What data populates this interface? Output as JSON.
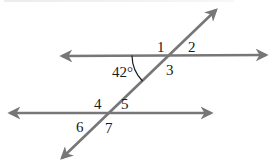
{
  "diagram": {
    "type": "parallel-lines-transversal",
    "colors": {
      "line": "#777777",
      "text": "#1a1a1a",
      "background": "#ffffff"
    },
    "lines": {
      "upper_parallel": {
        "x1": 62,
        "y1": 56,
        "x2": 266,
        "y2": 55
      },
      "lower_parallel": {
        "x1": 10,
        "y1": 113,
        "x2": 211,
        "y2": 113
      },
      "transversal": {
        "x1": 62,
        "y1": 158,
        "x2": 216,
        "y2": 10
      }
    },
    "given_angle": {
      "label": "42°",
      "value_degrees": 42
    },
    "angle_labels": [
      {
        "id": "1",
        "text": "1",
        "x": 157,
        "y": 52
      },
      {
        "id": "2",
        "text": "2",
        "x": 188,
        "y": 52
      },
      {
        "id": "3",
        "text": "3",
        "x": 166,
        "y": 75
      },
      {
        "id": "4",
        "text": "4",
        "x": 94,
        "y": 109
      },
      {
        "id": "5",
        "text": "5",
        "x": 121,
        "y": 109
      },
      {
        "id": "6",
        "text": "6",
        "x": 76,
        "y": 132
      },
      {
        "id": "7",
        "text": "7",
        "x": 105,
        "y": 133
      }
    ]
  }
}
